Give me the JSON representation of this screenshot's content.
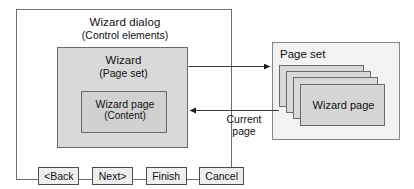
{
  "diagram": {
    "background_color": "#ffffff",
    "line_color": "#6b6b6b",
    "fill_gray": "#d9d9d9",
    "fill_light": "#f2f2f2"
  },
  "wizard_dialog": {
    "title": "Wizard dialog",
    "subtitle": "(Control elements)",
    "wizard_box": {
      "title": "Wizard",
      "subtitle": "(Page set)",
      "wizard_page_box": {
        "title": "Wizard page",
        "subtitle": "(Content)"
      }
    },
    "buttons": [
      {
        "label": "<Back",
        "name": "back-button"
      },
      {
        "label": "Next>",
        "name": "next-button"
      },
      {
        "label": "Finish",
        "name": "finish-button"
      },
      {
        "label": "Cancel",
        "name": "cancel-button"
      }
    ]
  },
  "page_set": {
    "title": "Page set",
    "cards": [
      {
        "label": ""
      },
      {
        "label": ""
      },
      {
        "label": ""
      },
      {
        "label": "Wizard page"
      }
    ]
  },
  "connectors": {
    "to_page_set": {
      "direction": "right",
      "label": ""
    },
    "from_page_set": {
      "direction": "left",
      "label": "Current\npage"
    },
    "current_page_label_line1": "Current",
    "current_page_label_line2": "page"
  }
}
